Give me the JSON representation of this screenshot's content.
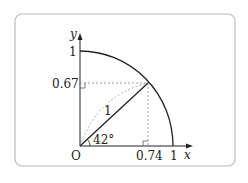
{
  "diagram": {
    "type": "unit-circle-quadrant",
    "origin_label": "O",
    "x_axis_label": "x",
    "y_axis_label": "y",
    "x_tick_labels": [
      "0.74",
      "1"
    ],
    "y_tick_labels": [
      "0.67",
      "1"
    ],
    "radius_label": "1",
    "angle_label": "42°",
    "angle_degrees": 42,
    "point": {
      "x": 0.74,
      "y": 0.67
    },
    "colors": {
      "stroke": "#222222",
      "dashed": "#888888",
      "frame": "#bbbbbb"
    }
  }
}
